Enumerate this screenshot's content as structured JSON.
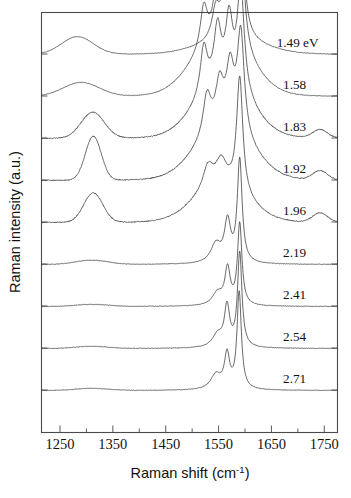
{
  "chart_data": {
    "type": "line",
    "title": "",
    "xlabel": "Raman shift (cm^-1)",
    "xlabel_main": "Raman shift (cm",
    "xlabel_sup": "-1",
    "xlabel_tail": ")",
    "ylabel": "Raman intensity (a.u.)",
    "xlim": [
      1215,
      1775
    ],
    "ylim": [
      0,
      10
    ],
    "grid": false,
    "legend_position": "inline-right-of-curve",
    "xticks": [
      1250,
      1350,
      1450,
      1550,
      1650,
      1750
    ],
    "xtick_labels": [
      "1250",
      "1350",
      "1450",
      "1550",
      "1650",
      "1750"
    ],
    "xminor_ticks": [
      1300,
      1400,
      1500,
      1600,
      1700
    ],
    "ytick_count": 9,
    "yticks_unlabeled": true,
    "note": "Stacked (waterfall) Raman spectra of carbon nanotubes at nine excitation laser energies; intensity axis is arbitrary units with each spectrum vertically offset.",
    "series": [
      {
        "name": "1.49 eV",
        "label": "1.49 eV",
        "baseline_offset": 9,
        "label_x": 1660,
        "d_band": {
          "center": 1283,
          "height": 0.42,
          "width": 30
        },
        "g_band_peaks": [
          {
            "center": 1545,
            "height": 0.75,
            "width": 9
          },
          {
            "center": 1562,
            "height": 1.15,
            "width": 7
          },
          {
            "center": 1590,
            "height": 4.9,
            "width": 6.5
          }
        ],
        "broad_background": {
          "center": 1575,
          "height": 0.3,
          "width": 60
        },
        "high_bump": null
      },
      {
        "name": "1.58",
        "label": "1.58",
        "baseline_offset": 8,
        "label_x": 1672,
        "d_band": {
          "center": 1290,
          "height": 0.33,
          "width": 34
        },
        "g_band_peaks": [
          {
            "center": 1522,
            "height": 0.95,
            "width": 8
          },
          {
            "center": 1548,
            "height": 1.35,
            "width": 8
          },
          {
            "center": 1568,
            "height": 1.25,
            "width": 8
          },
          {
            "center": 1592,
            "height": 2.55,
            "width": 8
          }
        ],
        "broad_background": {
          "center": 1555,
          "height": 1.35,
          "width": 52
        },
        "high_bump": null
      },
      {
        "name": "1.83",
        "label": "1.83",
        "baseline_offset": 7,
        "label_x": 1672,
        "d_band": {
          "center": 1312,
          "height": 0.62,
          "width": 22
        },
        "g_band_peaks": [
          {
            "center": 1522,
            "height": 1.1,
            "width": 8
          },
          {
            "center": 1548,
            "height": 1.25,
            "width": 8
          },
          {
            "center": 1570,
            "height": 1.45,
            "width": 8
          },
          {
            "center": 1592,
            "height": 2.45,
            "width": 8
          }
        ],
        "broad_background": {
          "center": 1558,
          "height": 1.3,
          "width": 50
        },
        "high_bump": {
          "center": 1742,
          "height": 0.2,
          "width": 14
        }
      },
      {
        "name": "1.92",
        "label": "1.92",
        "baseline_offset": 6,
        "label_x": 1672,
        "d_band": {
          "center": 1313,
          "height": 1.05,
          "width": 15
        },
        "g_band_peaks": [
          {
            "center": 1528,
            "height": 0.95,
            "width": 9
          },
          {
            "center": 1552,
            "height": 0.98,
            "width": 9
          },
          {
            "center": 1572,
            "height": 1.35,
            "width": 9
          },
          {
            "center": 1592,
            "height": 2.4,
            "width": 8
          }
        ],
        "broad_background": {
          "center": 1560,
          "height": 1.2,
          "width": 52
        },
        "high_bump": {
          "center": 1742,
          "height": 0.22,
          "width": 14
        }
      },
      {
        "name": "1.96",
        "label": "1.96",
        "baseline_offset": 5,
        "label_x": 1672,
        "d_band": {
          "center": 1313,
          "height": 0.7,
          "width": 18
        },
        "g_band_peaks": [
          {
            "center": 1530,
            "height": 0.55,
            "width": 12
          },
          {
            "center": 1555,
            "height": 0.55,
            "width": 12
          },
          {
            "center": 1590,
            "height": 2.75,
            "width": 7
          }
        ],
        "broad_background": {
          "center": 1555,
          "height": 0.85,
          "width": 50
        },
        "high_bump": {
          "center": 1742,
          "height": 0.22,
          "width": 14
        }
      },
      {
        "name": "2.19",
        "label": "2.19",
        "baseline_offset": 4,
        "label_x": 1672,
        "d_band": {
          "center": 1310,
          "height": 0.1,
          "width": 30
        },
        "g_band_peaks": [
          {
            "center": 1545,
            "height": 0.45,
            "width": 12
          },
          {
            "center": 1567,
            "height": 0.95,
            "width": 7
          },
          {
            "center": 1590,
            "height": 2.45,
            "width": 5.5
          }
        ],
        "broad_background": null,
        "high_bump": null
      },
      {
        "name": "2.41",
        "label": "2.41",
        "baseline_offset": 3,
        "label_x": 1672,
        "d_band": {
          "center": 1310,
          "height": 0.05,
          "width": 30
        },
        "g_band_peaks": [
          {
            "center": 1548,
            "height": 0.3,
            "width": 12
          },
          {
            "center": 1567,
            "height": 0.85,
            "width": 6
          },
          {
            "center": 1590,
            "height": 1.95,
            "width": 5
          }
        ],
        "broad_background": null,
        "high_bump": null
      },
      {
        "name": "2.54",
        "label": "2.54",
        "baseline_offset": 2,
        "label_x": 1672,
        "d_band": {
          "center": 1310,
          "height": 0.05,
          "width": 30
        },
        "g_band_peaks": [
          {
            "center": 1548,
            "height": 0.3,
            "width": 12
          },
          {
            "center": 1566,
            "height": 0.95,
            "width": 6
          },
          {
            "center": 1590,
            "height": 2.25,
            "width": 5
          }
        ],
        "broad_background": null,
        "high_bump": null
      },
      {
        "name": "2.71",
        "label": "2.71",
        "baseline_offset": 1,
        "label_x": 1672,
        "d_band": {
          "center": 1310,
          "height": 0.05,
          "width": 30
        },
        "g_band_peaks": [
          {
            "center": 1545,
            "height": 0.35,
            "width": 12
          },
          {
            "center": 1566,
            "height": 0.8,
            "width": 6
          },
          {
            "center": 1589,
            "height": 2.3,
            "width": 5
          }
        ],
        "broad_background": null,
        "high_bump": null
      }
    ]
  },
  "colors": {
    "curve": "#2b2b2b",
    "axis": "#4a4a4a",
    "text": "#111111",
    "background": "#ffffff"
  }
}
